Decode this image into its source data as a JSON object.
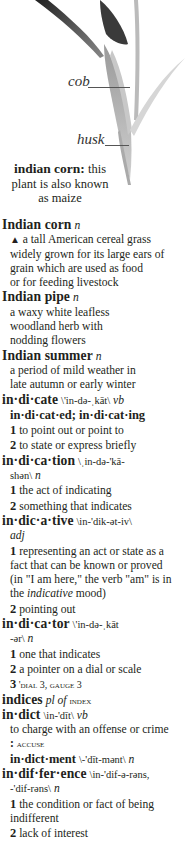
{
  "illustration": {
    "labels": {
      "cob": "cob",
      "husk": "husk"
    },
    "caption": {
      "term": "indian corn:",
      "text": " this plant is also known as maize"
    }
  },
  "entries": [
    {
      "type": "head",
      "word": "Indian corn",
      "pron": "",
      "pos": "n"
    },
    {
      "type": "text",
      "marker": "▲",
      "text": " a tall American cereal grass"
    },
    {
      "type": "text",
      "text": "widely grown for its large ears of"
    },
    {
      "type": "text",
      "text": "grain which are used as food"
    },
    {
      "type": "text",
      "text": "or for feeding livestock"
    },
    {
      "type": "head",
      "word": "Indian pipe",
      "pron": "",
      "pos": "n"
    },
    {
      "type": "text",
      "text": "a waxy white leafless"
    },
    {
      "type": "text",
      "text": "woodland herb with"
    },
    {
      "type": "text",
      "text": "nodding flowers"
    },
    {
      "type": "head",
      "word": "Indian summer",
      "pron": "",
      "pos": "n"
    },
    {
      "type": "text",
      "text": "a period of mild weather in"
    },
    {
      "type": "text",
      "text": "late autumn or early winter"
    },
    {
      "type": "head",
      "word": "in·di·cate",
      "pron": "\\'in-də-ˌkāt\\",
      "pos": "vb"
    },
    {
      "type": "inflect",
      "text": "in·di·cat·ed; in·di·cat·ing"
    },
    {
      "type": "sense",
      "num": "1",
      "text": " to point out or point to"
    },
    {
      "type": "sense",
      "num": "2",
      "text": " to state or express briefly"
    },
    {
      "type": "head",
      "word": "in·di·ca·tion",
      "pron": "\\ˌin-də-'kā-",
      "pos": ""
    },
    {
      "type": "cont",
      "pron": "shən\\",
      "pos": "n"
    },
    {
      "type": "sense",
      "num": "1",
      "text": " the act of indicating"
    },
    {
      "type": "sense",
      "num": "2",
      "text": " something that indicates"
    },
    {
      "type": "head",
      "word": "in·dic·a·tive",
      "pron": "\\in-'dik-ət-iv\\",
      "pos": ""
    },
    {
      "type": "cont",
      "pron": "",
      "pos": "adj"
    },
    {
      "type": "sense",
      "num": "1",
      "text": " representing an act or state as a"
    },
    {
      "type": "text",
      "text": "fact that can be known or proved"
    },
    {
      "type": "text",
      "text": "(in \"I am here,\" the verb \"am\" is in"
    },
    {
      "type": "mixed",
      "pre": "the ",
      "ital": "indicative",
      "post": " mood)"
    },
    {
      "type": "sense",
      "num": "2",
      "text": " pointing out"
    },
    {
      "type": "head",
      "word": "in·di·ca·tor",
      "pron": "\\'in-də-ˌkāt",
      "pos": ""
    },
    {
      "type": "cont",
      "pron": "-ər\\",
      "pos": "n"
    },
    {
      "type": "sense",
      "num": "1",
      "text": " one that indicates"
    },
    {
      "type": "sense",
      "num": "2",
      "text": " a pointer on a dial or scale"
    },
    {
      "type": "senseSc",
      "num": "3",
      "text": " 'dial 3, gauge 3"
    },
    {
      "type": "headSc",
      "word": "indices",
      "pos": "pl of",
      "ref": "index"
    },
    {
      "type": "head",
      "word": "in·dict",
      "pron": "\\in-'dīt\\",
      "pos": "vb"
    },
    {
      "type": "text",
      "text": "to charge with an offense or crime"
    },
    {
      "type": "colonSc",
      "text": "accuse"
    },
    {
      "type": "runon",
      "word": "in·dict·ment",
      "pron": "\\-'dīt-mənt\\",
      "pos": "n"
    },
    {
      "type": "head",
      "word": "in·dif·fer·ence",
      "pron": "\\in-'dif-ə-rəns,",
      "pos": ""
    },
    {
      "type": "cont",
      "pron": "-'dif-rəns\\",
      "pos": "n"
    },
    {
      "type": "sense",
      "num": "1",
      "text": " the condition or fact of being"
    },
    {
      "type": "text",
      "text": "indifferent"
    },
    {
      "type": "sense",
      "num": "2",
      "text": " lack of interest"
    }
  ]
}
